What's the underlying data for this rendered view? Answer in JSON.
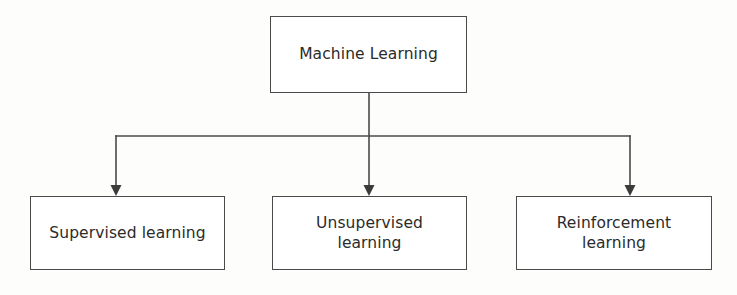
{
  "diagram": {
    "type": "tree-hierarchy",
    "orientation": "top-down",
    "background_color": "#fdfdfc",
    "stroke_color": "#4a4a4a",
    "text_color": "#2b2b2b",
    "root": {
      "id": "machine-learning",
      "label": "Machine Learning"
    },
    "children": [
      {
        "id": "supervised-learning",
        "label": "Supervised learning",
        "lines": 1
      },
      {
        "id": "unsupervised-learning",
        "label": "Unsupervised\nlearning",
        "lines": 2
      },
      {
        "id": "reinforcement-learning",
        "label": "Reinforcement\nlearning",
        "lines": 2
      }
    ],
    "connectors": {
      "style": "orthogonal-elbow",
      "arrowhead": "solid-triangle",
      "bus_y": 136,
      "stem_x": 369,
      "branch_x": [
        116,
        369,
        630
      ]
    }
  }
}
